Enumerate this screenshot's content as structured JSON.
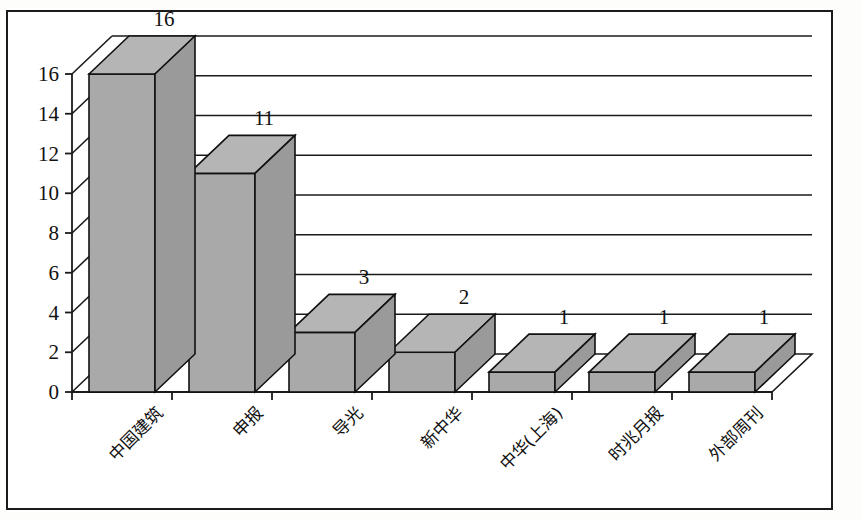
{
  "figure": {
    "background_color": "#ffffff",
    "frame_color": "#1b1b1b",
    "gridline_color": "#1a1a1a",
    "bar_front_color": "#a9a9a9",
    "bar_top_color": "#b5b5b5",
    "bar_side_color": "#9a9a9a",
    "bar_outline_color": "#111111"
  },
  "chart_data": {
    "type": "bar",
    "title": "",
    "subtitle": "",
    "xlabel": "",
    "ylabel": "",
    "categories": [
      "中国建筑",
      "申报",
      "导光",
      "新中华",
      "中华(上海)",
      "时兆月报",
      "外部周刊"
    ],
    "values": [
      16,
      11,
      3,
      2,
      1,
      1,
      1
    ],
    "data_labels": [
      "16",
      "11",
      "3",
      "2",
      "1",
      "1",
      "1"
    ],
    "ylim": [
      0,
      16
    ],
    "ytick_values": [
      0,
      2,
      4,
      6,
      8,
      10,
      12,
      14,
      16
    ],
    "ytick_labels": [
      "0",
      "2",
      "4",
      "6",
      "8",
      "10",
      "12",
      "14",
      "16"
    ],
    "grid": true,
    "grid_axis": "y",
    "legend": false,
    "legend_position": "none",
    "style": "3d-column",
    "annotations": []
  }
}
